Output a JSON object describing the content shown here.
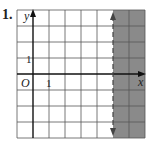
{
  "problem": {
    "number": "1."
  },
  "graph": {
    "x_axis_label": "x",
    "y_axis_label": "y",
    "origin_label": "O",
    "x_tick_label": "1",
    "y_tick_label": "1",
    "x_range": [
      -1,
      7
    ],
    "y_range": [
      -4,
      4
    ],
    "boundary": {
      "type": "dashed",
      "equation": "x = 5"
    },
    "shaded_region": "x > 5",
    "shade_color": "#8a8a8a",
    "grid_color": "#555555"
  }
}
